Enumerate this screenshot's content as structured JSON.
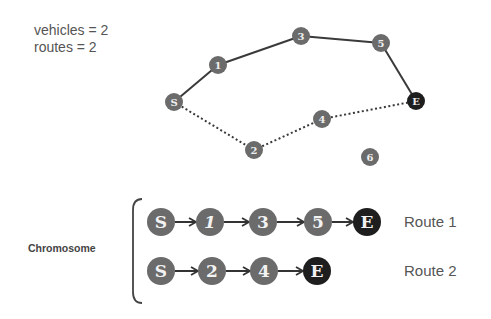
{
  "info": {
    "vehicles": "vehicles = 2",
    "routes": "routes = 2"
  },
  "graph": {
    "nodes": [
      {
        "id": "S",
        "x": 174,
        "y": 102,
        "type": "start"
      },
      {
        "id": "1",
        "x": 218,
        "y": 65,
        "type": "customer"
      },
      {
        "id": "3",
        "x": 301,
        "y": 36,
        "type": "customer"
      },
      {
        "id": "5",
        "x": 381,
        "y": 43,
        "type": "customer"
      },
      {
        "id": "E",
        "x": 416,
        "y": 101,
        "type": "end"
      },
      {
        "id": "4",
        "x": 322,
        "y": 119,
        "type": "customer"
      },
      {
        "id": "2",
        "x": 254,
        "y": 150,
        "type": "customer"
      },
      {
        "id": "6",
        "x": 370,
        "y": 157,
        "type": "customer"
      }
    ],
    "routes": [
      {
        "name": "Route 1",
        "path": [
          "S",
          "1",
          "3",
          "5",
          "E"
        ],
        "style": "solid"
      },
      {
        "name": "Route 2",
        "path": [
          "S",
          "2",
          "4",
          "E"
        ],
        "style": "dotted"
      }
    ]
  },
  "chromosome": {
    "label": "Chromosome",
    "rows": [
      {
        "label": "Route 1",
        "genes": [
          "S",
          "1",
          "3",
          "5",
          "E"
        ]
      },
      {
        "label": "Route 2",
        "genes": [
          "S",
          "2",
          "4",
          "E"
        ]
      }
    ]
  },
  "colors": {
    "node": "#6b6b6b",
    "end_node": "#1e1e1e",
    "edge": "#3a3a3a",
    "text": "#555555"
  }
}
